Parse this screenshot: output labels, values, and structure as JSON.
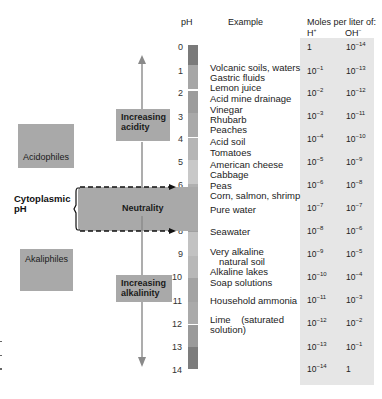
{
  "headers": {
    "ph": "pH",
    "example": "Example",
    "moles": "Moles per liter of:",
    "h_ion": "H",
    "h_sup": "+",
    "oh_ion": "OH",
    "oh_sup": "−"
  },
  "scale": {
    "ticks": [
      "0",
      "1",
      "2",
      "3",
      "4",
      "5",
      "6",
      "7",
      "8",
      "9",
      "10",
      "11",
      "12",
      "13",
      "14"
    ]
  },
  "examples": [
    "Volcanic soils, waters",
    "Gastric fluids",
    "Lemon juice",
    "Acid mine drainage",
    "Vinegar",
    "Rhubarb",
    "Peaches",
    "Acid soil",
    "Tomatoes",
    "American cheese",
    "Cabbage",
    "Peas",
    "Corn, salmon, shrimp",
    "Pure water",
    "Seawater",
    "Very alkaline",
    "natural soil",
    "Alkaline lakes",
    "Soap solutions",
    "Household ammonia",
    "Lime    (saturated",
    "solution)"
  ],
  "table": {
    "rows": [
      {
        "h_base": "1",
        "h_exp": "",
        "oh_base": "10",
        "oh_exp": "−14"
      },
      {
        "h_base": "10",
        "h_exp": "−1",
        "oh_base": "10",
        "oh_exp": "−13"
      },
      {
        "h_base": "10",
        "h_exp": "−2",
        "oh_base": "10",
        "oh_exp": "−12"
      },
      {
        "h_base": "10",
        "h_exp": "−3",
        "oh_base": "10",
        "oh_exp": "−11"
      },
      {
        "h_base": "10",
        "h_exp": "−4",
        "oh_base": "10",
        "oh_exp": "−10"
      },
      {
        "h_base": "10",
        "h_exp": "−5",
        "oh_base": "10",
        "oh_exp": "−9"
      },
      {
        "h_base": "10",
        "h_exp": "−6",
        "oh_base": "10",
        "oh_exp": "−8"
      },
      {
        "h_base": "10",
        "h_exp": "−7",
        "oh_base": "10",
        "oh_exp": "−7"
      },
      {
        "h_base": "10",
        "h_exp": "−8",
        "oh_base": "10",
        "oh_exp": "−6"
      },
      {
        "h_base": "10",
        "h_exp": "−9",
        "oh_base": "10",
        "oh_exp": "−5"
      },
      {
        "h_base": "10",
        "h_exp": "−10",
        "oh_base": "10",
        "oh_exp": "−4"
      },
      {
        "h_base": "10",
        "h_exp": "−11",
        "oh_base": "10",
        "oh_exp": "−3"
      },
      {
        "h_base": "10",
        "h_exp": "−12",
        "oh_base": "10",
        "oh_exp": "−2"
      },
      {
        "h_base": "10",
        "h_exp": "−13",
        "oh_base": "10",
        "oh_exp": "−1"
      },
      {
        "h_base": "10",
        "h_exp": "−14",
        "oh_base": "1",
        "oh_exp": ""
      }
    ]
  },
  "labels": {
    "increasing_acidity_1": "Increasing",
    "increasing_acidity_2": "acidity",
    "neutrality": "Neutrality",
    "increasing_alkalinity_1": "Increasing",
    "increasing_alkalinity_2": "alkalinity",
    "acidophiles": "Acidophiles",
    "akaliphiles": "Akaliphiles",
    "cytoplasmic_1": "Cytoplasmic",
    "cytoplasmic_2": "pH"
  },
  "colors": {
    "box_gray": "#a9a9a9",
    "table_bg": "#e6e6e6",
    "arrow": "#8a8a8a"
  }
}
